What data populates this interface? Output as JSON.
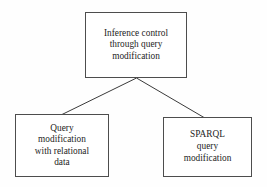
{
  "diagram": {
    "type": "tree",
    "orientation": "top-down",
    "background_color": "#fefefe",
    "border_color": "#4d4d4d",
    "text_color": "#1d1d1d",
    "connector_color": "#3a3a3a",
    "nodes": {
      "root": {
        "label": "Inference control\nthrough query\nmodification",
        "lines": [
          "Inference control",
          "through query",
          "modification"
        ]
      },
      "relational": {
        "label": "Query\nmodification\nwith relational\ndata",
        "lines": [
          "Query",
          "modification",
          "with relational",
          "data"
        ]
      },
      "sparql": {
        "label": "SPARQL\nquery\nmodification",
        "lines": [
          "SPARQL",
          "query",
          "modification"
        ]
      }
    },
    "edges": [
      {
        "from": "root",
        "to": "relational"
      },
      {
        "from": "root",
        "to": "sparql"
      }
    ]
  }
}
